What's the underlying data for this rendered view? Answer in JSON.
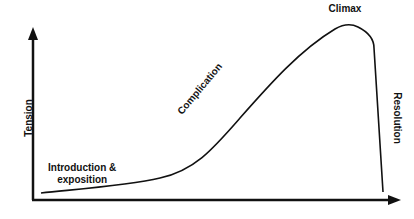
{
  "diagram": {
    "title": "",
    "y_axis_label": "Tension",
    "x_axis_label": "",
    "stages": {
      "introduction": "Introduction &",
      "introduction_line2": "exposition",
      "complication": "Complication",
      "climax": "Climax",
      "resolution": "Resolution"
    },
    "colors": {
      "line": "#111111",
      "background": "#ffffff"
    }
  }
}
